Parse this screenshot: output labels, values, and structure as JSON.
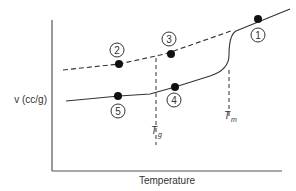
{
  "diagram": {
    "title": "",
    "y_axis_label": "v (cc/g)",
    "x_axis_label": "Temperature",
    "markers": [
      {
        "id": "Tg",
        "label_main": "T",
        "label_sub": "g"
      },
      {
        "id": "Tm",
        "label_main": "T",
        "label_sub": "m"
      }
    ],
    "points": [
      {
        "n": "1",
        "desc": "melt, above Tm"
      },
      {
        "n": "2",
        "desc": "extrapolated liquid line, below Tg"
      },
      {
        "n": "3",
        "desc": "liquid line at Tg region"
      },
      {
        "n": "4",
        "desc": "solid line just above Tg"
      },
      {
        "n": "5",
        "desc": "glass/solid below Tg"
      }
    ],
    "lines": {
      "solid": "specific volume (semicrystalline path)",
      "dashed": "supercooled liquid extrapolation"
    },
    "colors": {
      "line": "#333333",
      "point": "#111111",
      "axis": "#555555"
    }
  }
}
